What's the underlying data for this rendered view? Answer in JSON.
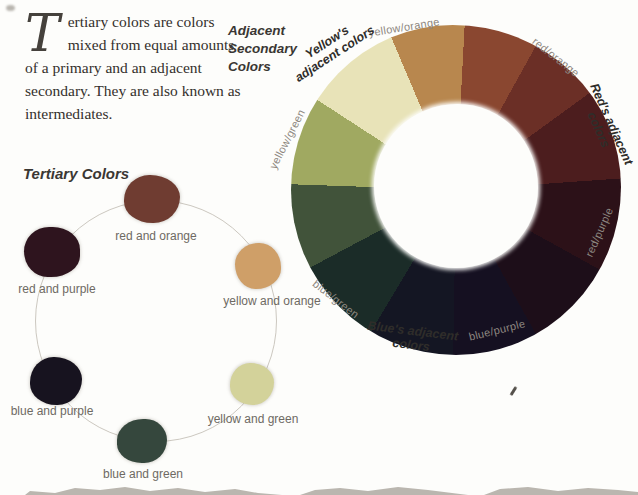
{
  "page": {
    "intro_dropcap": "T",
    "intro_text": "ertiary colors are colors mixed from equal amounts of a primary and an adjacent secondary. They are also known as intermediates."
  },
  "secondary_wheel": {
    "heading": "Adjacent Secondary Colors",
    "start_angle": 303,
    "segments": [
      {
        "name": "pale-yellow",
        "color": "#e8e3b8",
        "sweep": 34
      },
      {
        "name": "orange",
        "color": "#b8874e",
        "sweep": 26
      },
      {
        "name": "orange-red",
        "color": "#8a4730",
        "sweep": 26
      },
      {
        "name": "red-orange",
        "color": "#6b2f26",
        "sweep": 25
      },
      {
        "name": "red",
        "color": "#4c1d1e",
        "sweep": 32
      },
      {
        "name": "red-purple",
        "color": "#2c1118",
        "sweep": 33
      },
      {
        "name": "purple",
        "color": "#1d0e19",
        "sweep": 32
      },
      {
        "name": "blue-purple",
        "color": "#151021",
        "sweep": 30
      },
      {
        "name": "blue",
        "color": "#141623",
        "sweep": 30
      },
      {
        "name": "blue-green",
        "color": "#1b2c28",
        "sweep": 31
      },
      {
        "name": "green",
        "color": "#41533a",
        "sweep": 30
      },
      {
        "name": "yellow-green",
        "color": "#a0a961",
        "sweep": 31
      }
    ],
    "segment_labels": [
      {
        "id": "yellow-orange",
        "text": "yellow/orange"
      },
      {
        "id": "red-orange",
        "text": "red/orange"
      },
      {
        "id": "red-purple",
        "text": "red/purple"
      },
      {
        "id": "blue-purple",
        "text": "blue/purple"
      },
      {
        "id": "blue-green",
        "text": "blue/green"
      },
      {
        "id": "yellow-green",
        "text": "yellow/green"
      }
    ],
    "group_labels": [
      {
        "id": "yellow",
        "text": "Yellow's adjacent colors"
      },
      {
        "id": "red",
        "text": "Red's adjacent colors"
      },
      {
        "id": "blue",
        "text": "Blue's adjacent colors"
      }
    ]
  },
  "tertiary": {
    "heading": "Tertiary Colors",
    "swatches": [
      {
        "label": "red and orange",
        "color": "#6f3c31"
      },
      {
        "label": "yellow and orange",
        "color": "#cf9f68"
      },
      {
        "label": "yellow and green",
        "color": "#d3d29a"
      },
      {
        "label": "blue and green",
        "color": "#35473d"
      },
      {
        "label": "blue and purple",
        "color": "#17131f"
      },
      {
        "label": "red and purple",
        "color": "#2e141e"
      }
    ]
  }
}
